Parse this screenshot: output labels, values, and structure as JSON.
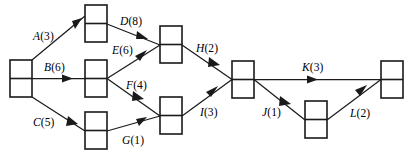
{
  "diagram": {
    "kind": "activity-on-arrow-project-network",
    "width": 413,
    "height": 164,
    "stroke_color": "#1a1a1a",
    "background_color": "#ffffff",
    "node_fill": "#ffffff",
    "node_shape": "rectangle-split-horizontally",
    "node_width": 22,
    "node_height": 37
  },
  "nodes": [
    {
      "id": "n1",
      "name": "start-node",
      "x": 10,
      "y": 60
    },
    {
      "id": "n2",
      "name": "top-left-node",
      "x": 85,
      "y": 5
    },
    {
      "id": "n3",
      "name": "middle-left-node",
      "x": 85,
      "y": 60
    },
    {
      "id": "n4",
      "name": "bottom-left-node",
      "x": 85,
      "y": 112
    },
    {
      "id": "n5",
      "name": "upper-mid-node",
      "x": 160,
      "y": 26
    },
    {
      "id": "n6",
      "name": "lower-mid-node",
      "x": 160,
      "y": 97
    },
    {
      "id": "n7",
      "name": "merge-node",
      "x": 232,
      "y": 61
    },
    {
      "id": "n8",
      "name": "lower-right-node",
      "x": 305,
      "y": 101
    },
    {
      "id": "n9",
      "name": "end-node",
      "x": 381,
      "y": 61
    }
  ],
  "edges": [
    {
      "id": "A",
      "name": "edge-a",
      "activity": "A",
      "duration": 3,
      "label": "A(3)",
      "from": "n1",
      "to": "n2",
      "label_x": 33,
      "label_y": 31
    },
    {
      "id": "B",
      "name": "edge-b",
      "activity": "B",
      "duration": 6,
      "label": "B(6)",
      "from": "n1",
      "to": "n3",
      "label_x": 44,
      "label_y": 62
    },
    {
      "id": "C",
      "name": "edge-c",
      "activity": "C",
      "duration": 5,
      "label": "C(5)",
      "from": "n1",
      "to": "n4",
      "label_x": 33,
      "label_y": 117
    },
    {
      "id": "D",
      "name": "edge-d",
      "activity": "D",
      "duration": 8,
      "label": "D(8)",
      "from": "n2",
      "to": "n5",
      "label_x": 120,
      "label_y": 16
    },
    {
      "id": "E",
      "name": "edge-e",
      "activity": "E",
      "duration": 6,
      "label": "E(6)",
      "from": "n3",
      "to": "n5",
      "label_x": 112,
      "label_y": 45
    },
    {
      "id": "F",
      "name": "edge-f",
      "activity": "F",
      "duration": 4,
      "label": "F(4)",
      "from": "n3",
      "to": "n6",
      "label_x": 126,
      "label_y": 80
    },
    {
      "id": "G",
      "name": "edge-g",
      "activity": "G",
      "duration": 1,
      "label": "G(1)",
      "from": "n4",
      "to": "n6",
      "label_x": 122,
      "label_y": 135
    },
    {
      "id": "H",
      "name": "edge-h",
      "activity": "H",
      "duration": 2,
      "label": "H(2)",
      "from": "n5",
      "to": "n7",
      "label_x": 196,
      "label_y": 43
    },
    {
      "id": "I",
      "name": "edge-i",
      "activity": "I",
      "duration": 3,
      "label": "I(3)",
      "from": "n6",
      "to": "n7",
      "label_x": 200,
      "label_y": 107
    },
    {
      "id": "K",
      "name": "edge-k",
      "activity": "K",
      "duration": 3,
      "label": "K(3)",
      "from": "n7",
      "to": "n9",
      "label_x": 302,
      "label_y": 62
    },
    {
      "id": "J",
      "name": "edge-j",
      "activity": "J",
      "duration": 1,
      "label": "J(1)",
      "from": "n7",
      "to": "n8",
      "label_x": 262,
      "label_y": 107
    },
    {
      "id": "L",
      "name": "edge-l",
      "activity": "L",
      "duration": 2,
      "label": "L(2)",
      "from": "n8",
      "to": "n9",
      "label_x": 350,
      "label_y": 108
    }
  ]
}
